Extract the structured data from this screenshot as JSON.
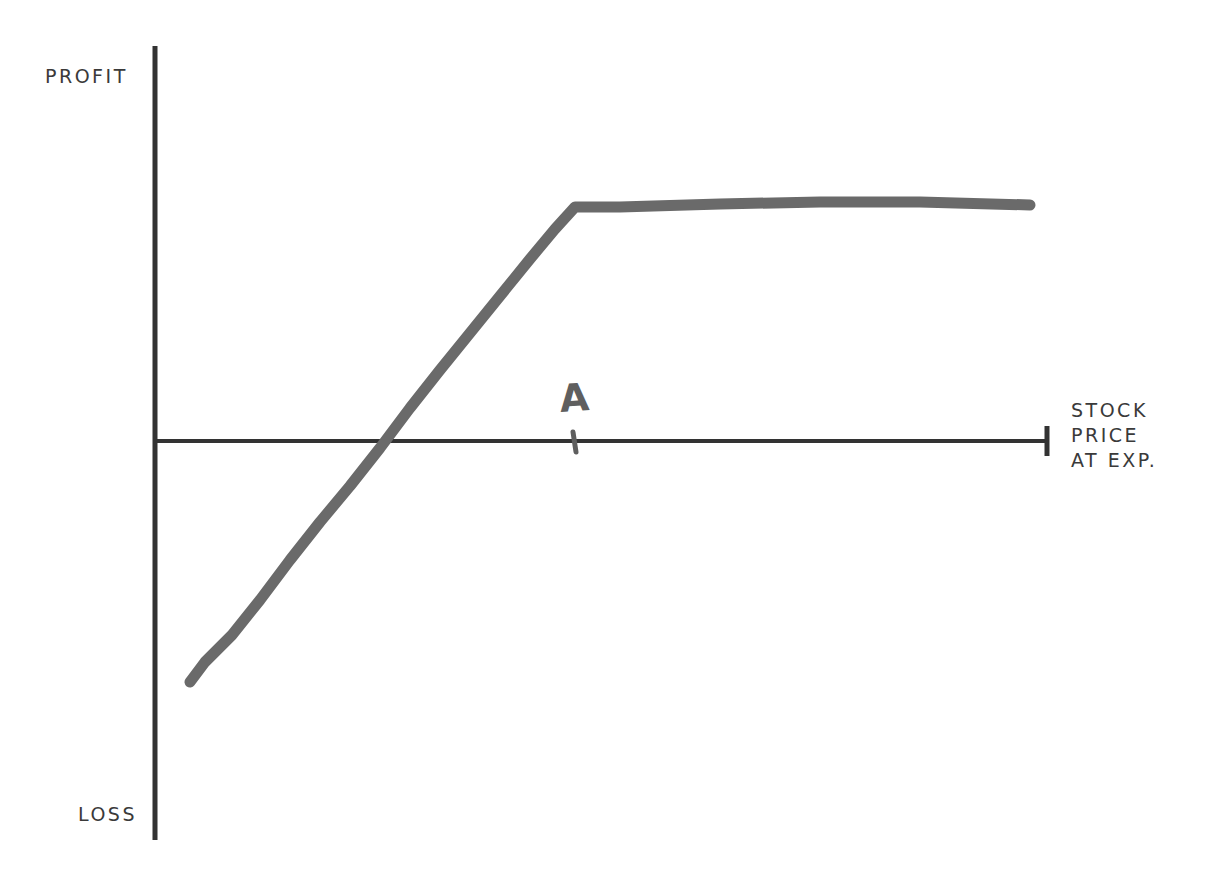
{
  "diagram": {
    "type": "payoff-diagram",
    "labels": {
      "y_top": "PROFIT",
      "y_bottom": "LOSS",
      "x_axis_lines": [
        "STOCK",
        "PRICE",
        "AT EXP."
      ],
      "marker": "A"
    },
    "colors": {
      "axis": "#333333",
      "payoff_line": "#6a6a6a",
      "text": "#3a3a3a",
      "background": "#ffffff"
    },
    "payoff_points_px": [
      [
        190,
        682
      ],
      [
        575,
        207
      ],
      [
        1030,
        205
      ]
    ]
  }
}
